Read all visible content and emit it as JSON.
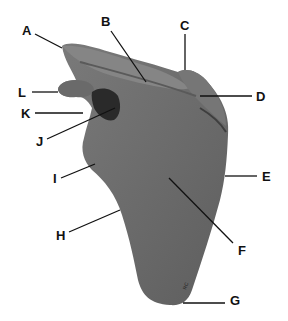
{
  "figure": {
    "colors": {
      "background": "#ffffff",
      "bone": "#6e6e6e",
      "bone_dark": "#3a3a3a",
      "leader_line": "#111111",
      "label": "#111111"
    },
    "labels": [
      {
        "id": "A",
        "text": "A",
        "x": 22,
        "y": 24,
        "line": [
          35,
          34,
          62,
          48
        ]
      },
      {
        "id": "B",
        "text": "B",
        "x": 101,
        "y": 15,
        "line": [
          111,
          31,
          146,
          82
        ]
      },
      {
        "id": "C",
        "text": "C",
        "x": 180,
        "y": 19,
        "line": [
          185,
          34,
          185,
          70
        ]
      },
      {
        "id": "D",
        "text": "D",
        "x": 256,
        "y": 90,
        "line": [
          200,
          96,
          252,
          96
        ]
      },
      {
        "id": "E",
        "text": "E",
        "x": 262,
        "y": 170,
        "line": [
          225,
          176,
          257,
          176
        ]
      },
      {
        "id": "F",
        "text": "F",
        "x": 238,
        "y": 244,
        "line": [
          169,
          178,
          233,
          243
        ]
      },
      {
        "id": "G",
        "text": "G",
        "x": 230,
        "y": 294,
        "line": [
          183,
          303,
          225,
          303
        ]
      },
      {
        "id": "H",
        "text": "H",
        "x": 56,
        "y": 229,
        "line": [
          69,
          232,
          120,
          210
        ]
      },
      {
        "id": "I",
        "text": "I",
        "x": 53,
        "y": 172,
        "line": [
          61,
          178,
          95,
          164
        ]
      },
      {
        "id": "J",
        "text": "J",
        "x": 36,
        "y": 135,
        "line": [
          47,
          139,
          115,
          108
        ]
      },
      {
        "id": "K",
        "text": "K",
        "x": 21,
        "y": 107,
        "line": [
          35,
          113,
          83,
          113
        ]
      },
      {
        "id": "L",
        "text": "L",
        "x": 18,
        "y": 86,
        "line": [
          32,
          92,
          58,
          92
        ]
      }
    ]
  }
}
